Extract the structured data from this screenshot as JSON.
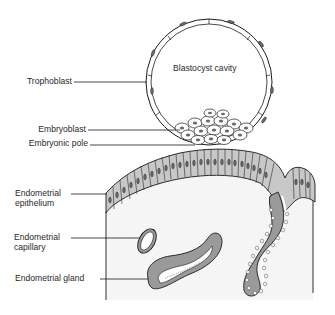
{
  "diagram": {
    "type": "anatomical-illustration",
    "colors": {
      "line": "#1a1a1a",
      "epithelium_fill": "#c8c8c8",
      "stroma_fill": "#f4f4f4",
      "background": "#ffffff",
      "nucleus_fill": "#6a6a6a"
    },
    "inner_label": "Blastocyst cavity",
    "labels": [
      {
        "id": "trophoblast",
        "lines": [
          "Trophoblast"
        ]
      },
      {
        "id": "embryoblast",
        "lines": [
          "Embryoblast"
        ]
      },
      {
        "id": "embryonic-pole",
        "lines": [
          "Embryonic pole"
        ]
      },
      {
        "id": "endometrial-epithelium",
        "lines": [
          "Endometrial",
          "epithelium"
        ]
      },
      {
        "id": "endometrial-capillary",
        "lines": [
          "Endometrial",
          "capillary"
        ]
      },
      {
        "id": "endometrial-gland",
        "lines": [
          "Endometrial gland"
        ]
      }
    ]
  }
}
